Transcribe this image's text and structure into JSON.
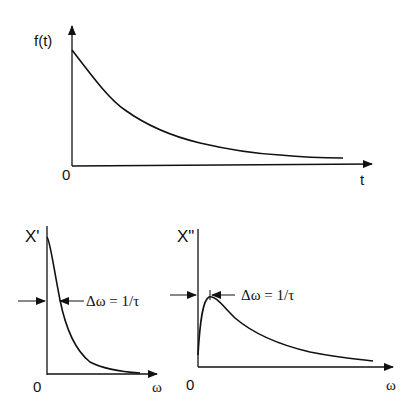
{
  "top_plot": {
    "ylabel": "f(t)",
    "xlabel": "t",
    "origin": "0",
    "curve": "exponential decay"
  },
  "bottom_left_plot": {
    "ylabel": "X'",
    "xlabel": "ω",
    "origin": "0",
    "annotation": "Δω = 1/τ",
    "curve": "real part (Lorentzian)"
  },
  "bottom_right_plot": {
    "ylabel": "X\"",
    "xlabel": "ω",
    "origin": "0",
    "annotation": "Δω = 1/τ",
    "curve": "imaginary part (peaked)"
  },
  "colors": {
    "line": "#111111",
    "background": "#ffffff"
  }
}
